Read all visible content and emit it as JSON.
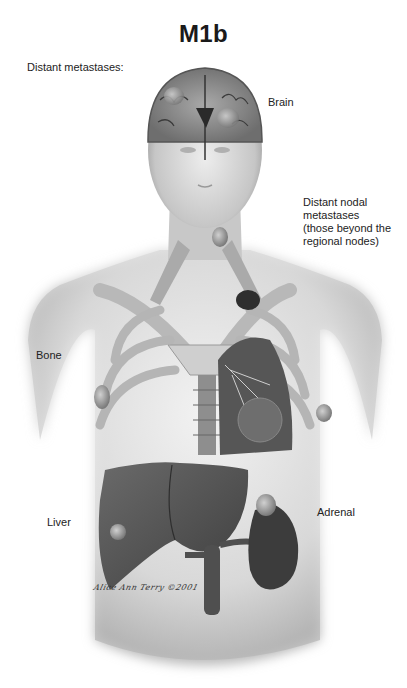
{
  "figure": {
    "title": "M1b",
    "subtitle": "Distant metastases:",
    "labels": {
      "brain": "Brain",
      "distant_nodal_1": "Distant nodal",
      "distant_nodal_2": "metastases",
      "distant_nodal_3": "(those beyond the",
      "distant_nodal_4": "regional nodes)",
      "bone": "Bone",
      "liver": "Liver",
      "adrenal": "Adrenal"
    },
    "signature": "Alice Ann Terry ©2001",
    "colors": {
      "skin": "#d9d9d9",
      "skin_shadow": "#a8a8a8",
      "bone": "#bdbdbd",
      "organ_dark": "#4a4a4a",
      "organ_mid": "#6b6b6b",
      "tumor": "#9a9a9a"
    }
  }
}
